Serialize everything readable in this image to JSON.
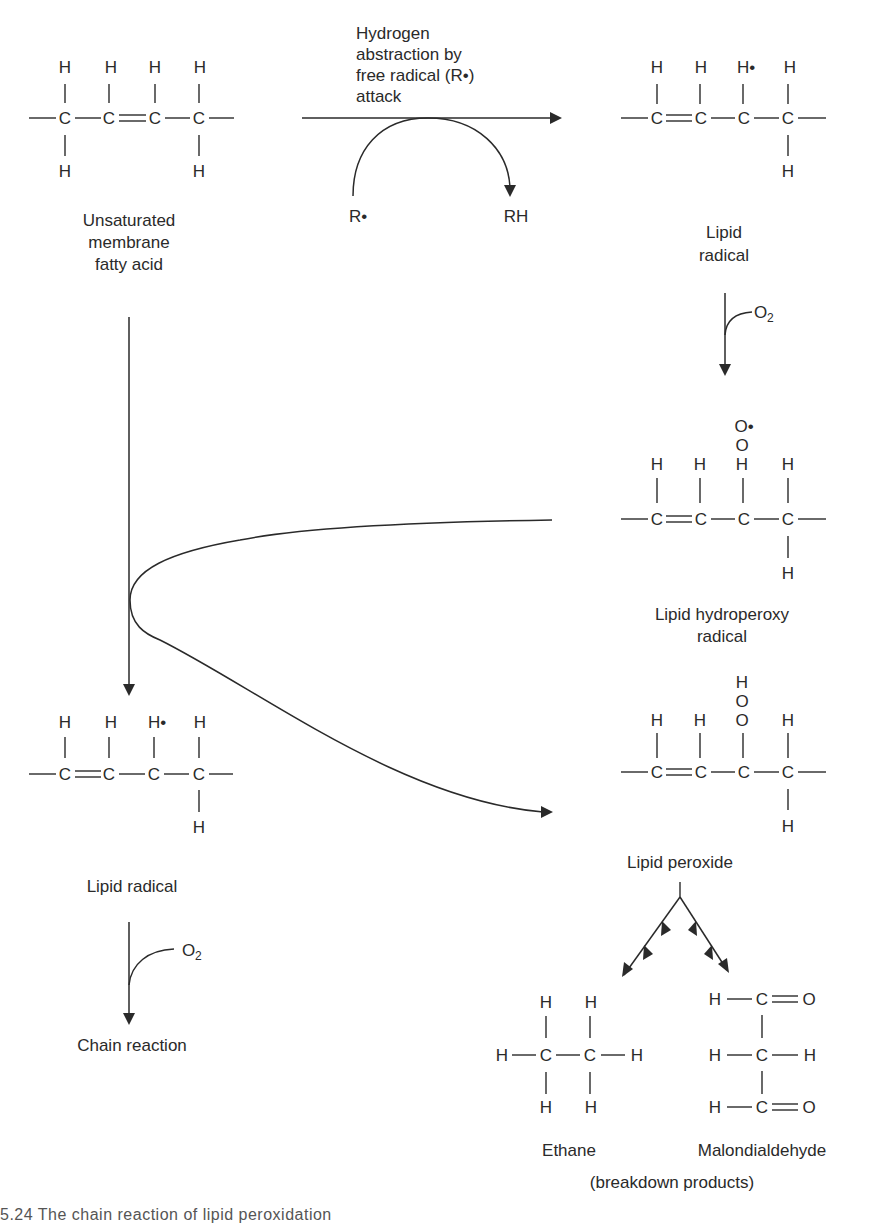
{
  "diagram": {
    "molecules": {
      "unsaturated_fatty_acid": {
        "label_lines": [
          "Unsaturated",
          "membrane",
          "fatty acid"
        ],
        "top_atoms": [
          "H",
          "H",
          "H",
          "H"
        ],
        "chain": [
          "C",
          "C",
          "C",
          "C"
        ],
        "bottom_atoms": [
          "H",
          "H"
        ]
      },
      "lipid_radical_top": {
        "label_lines": [
          "Lipid",
          "radical"
        ],
        "top_atoms": [
          "H",
          "H",
          "H•",
          "H"
        ],
        "chain": [
          "C",
          "C",
          "C",
          "C"
        ],
        "bottom_atoms": [
          "H"
        ]
      },
      "lipid_hydroperoxy_radical": {
        "label_lines": [
          "Lipid hydroperoxy",
          "radical"
        ],
        "stack": [
          "O•",
          "O",
          "H"
        ],
        "top_atoms": [
          "H",
          "H",
          "H"
        ],
        "chain": [
          "C",
          "C",
          "C",
          "C"
        ],
        "bottom_atoms": [
          "H"
        ]
      },
      "lipid_radical_bottom": {
        "label": "Lipid radical",
        "top_atoms": [
          "H",
          "H",
          "H•",
          "H"
        ],
        "chain": [
          "C",
          "C",
          "C",
          "C"
        ],
        "bottom_atoms": [
          "H"
        ]
      },
      "lipid_peroxide": {
        "label": "Lipid peroxide",
        "stack": [
          "H",
          "O",
          "O"
        ],
        "top_atoms": [
          "H",
          "H",
          "H"
        ],
        "chain": [
          "C",
          "C",
          "C",
          "C"
        ],
        "bottom_atoms": [
          "H"
        ]
      },
      "ethane": {
        "label": "Ethane",
        "atoms": [
          "H",
          "H",
          "H",
          "C",
          "C",
          "H",
          "H",
          "H"
        ]
      },
      "malondialdehyde": {
        "label": "Malondialdehyde",
        "rows": [
          [
            "H",
            "C",
            "O"
          ],
          [
            "H",
            "C",
            "H"
          ],
          [
            "H",
            "C",
            "O"
          ]
        ]
      }
    },
    "reactions": {
      "abstraction_label_lines": [
        "Hydrogen",
        "abstraction by",
        "free radical (R•)",
        "attack"
      ],
      "reactant_radical": "R•",
      "product_rh": "RH",
      "oxygen_1": "O",
      "oxygen_1_sub": "2",
      "oxygen_2": "O",
      "oxygen_2_sub": "2",
      "chain_reaction": "Chain reaction",
      "breakdown_products": "(breakdown products)"
    },
    "caption": "5.24  The chain reaction of lipid peroxidation"
  }
}
